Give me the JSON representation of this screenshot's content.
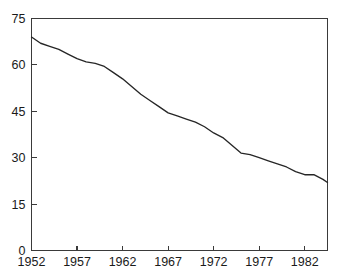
{
  "chart_data": {
    "type": "line",
    "title": "",
    "xlabel": "",
    "ylabel": "",
    "xlim": [
      1952,
      1984.5
    ],
    "ylim": [
      0,
      75
    ],
    "grid": false,
    "legend": null,
    "x_ticks": [
      1952,
      1957,
      1962,
      1967,
      1972,
      1977,
      1982
    ],
    "x_tick_labels": [
      "1952",
      "1957",
      "1962",
      "1967",
      "1972",
      "1977",
      "1982"
    ],
    "y_ticks": [
      0,
      15,
      30,
      45,
      60,
      75
    ],
    "y_tick_labels": [
      "0",
      "15",
      "30",
      "45",
      "60",
      "75"
    ],
    "line_color": "#262626",
    "axis_color": "#3a3a3a",
    "background_color": "#ffffff",
    "series": [
      {
        "name": "series-1",
        "x": [
          1952,
          1953,
          1954,
          1955,
          1956,
          1957,
          1958,
          1959,
          1960,
          1961,
          1962,
          1963,
          1964,
          1965,
          1966,
          1967,
          1968,
          1969,
          1970,
          1971,
          1972,
          1973,
          1974,
          1975,
          1976,
          1977,
          1978,
          1979,
          1980,
          1981,
          1982,
          1983,
          1984,
          1984.5
        ],
        "values": [
          69.0,
          67.0,
          66.0,
          65.0,
          63.5,
          62.0,
          61.0,
          60.5,
          59.5,
          57.5,
          55.5,
          53.0,
          50.5,
          48.5,
          46.5,
          44.5,
          43.5,
          42.5,
          41.5,
          40.0,
          38.0,
          36.5,
          34.0,
          31.5,
          31.0,
          30.0,
          29.0,
          28.0,
          27.0,
          25.5,
          24.5,
          24.5,
          23.0,
          22.0
        ]
      }
    ]
  }
}
